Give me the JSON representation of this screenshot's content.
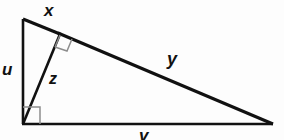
{
  "figure": {
    "background_color": "#fdfdfd",
    "stroke_color": "#111111",
    "right_angle_mark_color": "#8d8d8d",
    "labels": {
      "x": "x",
      "u": "u",
      "z": "z",
      "y": "y",
      "v": "v"
    },
    "label_descriptions": {
      "x": "upper segment of the hypotenuse, from the apex to the foot of the altitude",
      "u": "vertical leg on the left side of the triangle",
      "z": "altitude drawn from the right-angle vertex to the hypotenuse",
      "y": "lower segment of the hypotenuse, from the foot of the altitude to the right vertex",
      "v": "horizontal leg along the bottom of the triangle"
    },
    "geometry": {
      "apex_top_left": [
        23,
        19
      ],
      "right_angle_vertex_bottom_left": [
        23,
        124
      ],
      "vertex_bottom_right": [
        272,
        124
      ],
      "altitude_foot_on_hypotenuse": [
        60,
        34
      ],
      "right_angle_marks": [
        {
          "at": "bottom-left-vertex",
          "size": 16
        },
        {
          "at": "altitude-foot",
          "size": 13,
          "rotated": true
        }
      ]
    }
  }
}
